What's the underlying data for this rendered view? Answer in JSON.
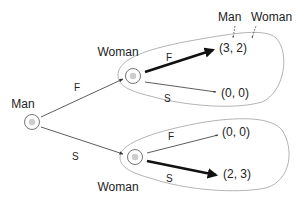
{
  "diagram": {
    "type": "extensive-form-game-tree",
    "header": {
      "player1": "Man",
      "player2": "Woman"
    },
    "root": {
      "label": "Man"
    },
    "branches": [
      {
        "action": "F",
        "node_label": "Woman",
        "outcomes": [
          {
            "action": "F",
            "payoff": "(3, 2)",
            "equilibrium": true
          },
          {
            "action": "S",
            "payoff": "(0, 0)",
            "equilibrium": false
          }
        ]
      },
      {
        "action": "S",
        "node_label": "Woman",
        "outcomes": [
          {
            "action": "F",
            "payoff": "(0, 0)",
            "equilibrium": false
          },
          {
            "action": "S",
            "payoff": "(2, 3)",
            "equilibrium": true
          }
        ]
      }
    ],
    "colors": {
      "line": "#333333",
      "bold": "#111111",
      "balloon": "#aaaaaa",
      "node_fill": "#cccccc",
      "text": "#222222"
    }
  }
}
